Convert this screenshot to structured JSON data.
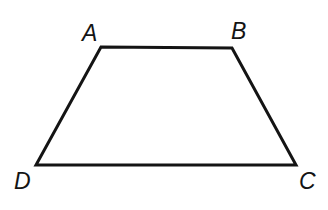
{
  "figure": {
    "kind": "trapezoid",
    "name": "Trapezoid ABCD",
    "background_color": "#ffffff",
    "stroke_color": "#141414",
    "stroke_width": 3,
    "canvas": {
      "width": 328,
      "height": 210
    },
    "vertices": [
      {
        "id": "A",
        "label": "A",
        "x": 101,
        "y": 47,
        "label_x": 82,
        "label_y": 22
      },
      {
        "id": "B",
        "label": "B",
        "x": 232,
        "y": 48,
        "label_x": 231,
        "label_y": 20
      },
      {
        "id": "C",
        "label": "C",
        "x": 296,
        "y": 165,
        "label_x": 299,
        "label_y": 170
      },
      {
        "id": "D",
        "label": "D",
        "x": 36,
        "y": 165,
        "label_x": 14,
        "label_y": 170
      }
    ],
    "edges": [
      {
        "id": "AB",
        "from": "A",
        "to": "B"
      },
      {
        "id": "BC",
        "from": "B",
        "to": "C"
      },
      {
        "id": "CD",
        "from": "C",
        "to": "D"
      },
      {
        "id": "DA",
        "from": "D",
        "to": "A"
      }
    ],
    "path": "M 101 47 L 232 48 L 296 165 L 36 165 Z"
  }
}
